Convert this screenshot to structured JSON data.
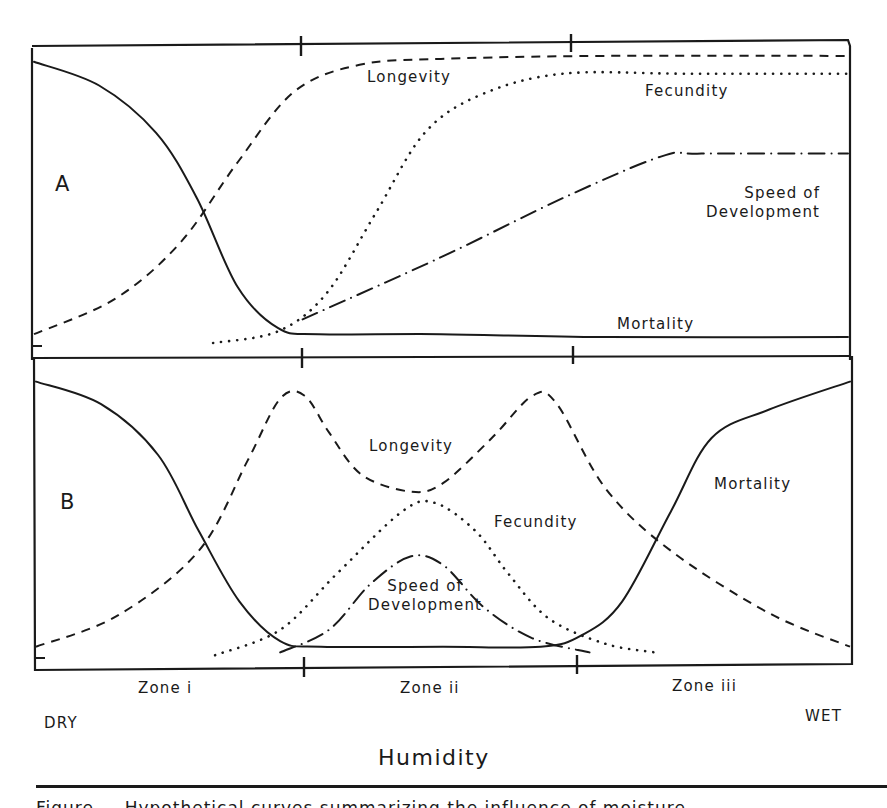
{
  "figure": {
    "panel_a_label": "A",
    "panel_b_label": "B",
    "axis_title": "Humidity",
    "dry_label": "DRY",
    "wet_label": "WET",
    "zones": [
      "Zone i",
      "Zone ii",
      "Zone iii"
    ],
    "caption": "Figure — Hypothetical curves summarizing the influence of moisture ..."
  },
  "labels": {
    "a": {
      "longevity": "Longevity",
      "fecundity": "Fecundity",
      "speed_line1": "Speed of",
      "speed_line2": "Development",
      "mortality": "Mortality"
    },
    "b": {
      "longevity": "Longevity",
      "fecundity": "Fecundity",
      "speed_line1": "Speed of",
      "speed_line2": "Development",
      "mortality": "Mortality"
    }
  },
  "colors": {
    "ink": "#1a1a1a",
    "background": "#ffffff"
  },
  "chart_data": {
    "type": "line",
    "title": "",
    "xlabel": "Humidity",
    "x_range_labels": [
      "DRY",
      "WET"
    ],
    "zone_boundaries": [
      "Zone i | Zone ii",
      "Zone ii | Zone iii"
    ],
    "zones": [
      "Zone i",
      "Zone ii",
      "Zone iii"
    ],
    "note": "Hypothetical (unitless) curves; x = 0 (dry) to 1 (wet), y = 0 (low) to 1 (high). Zone boundaries at x≈0.33 and x≈0.67.",
    "grid": false,
    "panels": [
      {
        "panel": "A",
        "series": [
          {
            "name": "Mortality",
            "style": "solid",
            "points": [
              [
                0,
                0.96
              ],
              [
                0.08,
                0.88
              ],
              [
                0.15,
                0.72
              ],
              [
                0.2,
                0.5
              ],
              [
                0.25,
                0.2
              ],
              [
                0.3,
                0.06
              ],
              [
                0.35,
                0.04
              ],
              [
                0.5,
                0.04
              ],
              [
                0.7,
                0.03
              ],
              [
                1,
                0.03
              ]
            ]
          },
          {
            "name": "Longevity",
            "style": "dashed",
            "points": [
              [
                0,
                0.04
              ],
              [
                0.1,
                0.16
              ],
              [
                0.18,
                0.35
              ],
              [
                0.25,
                0.62
              ],
              [
                0.32,
                0.86
              ],
              [
                0.4,
                0.95
              ],
              [
                0.5,
                0.97
              ],
              [
                0.7,
                0.98
              ],
              [
                1,
                0.98
              ]
            ]
          },
          {
            "name": "Fecundity",
            "style": "dotted",
            "points": [
              [
                0.22,
                0.01
              ],
              [
                0.3,
                0.05
              ],
              [
                0.36,
                0.18
              ],
              [
                0.42,
                0.45
              ],
              [
                0.48,
                0.72
              ],
              [
                0.55,
                0.85
              ],
              [
                0.65,
                0.92
              ],
              [
                0.8,
                0.92
              ],
              [
                1,
                0.92
              ]
            ]
          },
          {
            "name": "Speed of Development",
            "style": "dash-dot",
            "points": [
              [
                0.33,
                0.09
              ],
              [
                0.5,
                0.3
              ],
              [
                0.65,
                0.5
              ],
              [
                0.77,
                0.64
              ],
              [
                0.82,
                0.65
              ],
              [
                1,
                0.65
              ]
            ]
          }
        ]
      },
      {
        "panel": "B",
        "series": [
          {
            "name": "Mortality",
            "style": "solid",
            "points": [
              [
                0,
                0.98
              ],
              [
                0.08,
                0.9
              ],
              [
                0.15,
                0.72
              ],
              [
                0.2,
                0.45
              ],
              [
                0.25,
                0.2
              ],
              [
                0.3,
                0.06
              ],
              [
                0.35,
                0.04
              ],
              [
                0.5,
                0.04
              ],
              [
                0.62,
                0.04
              ],
              [
                0.67,
                0.08
              ],
              [
                0.72,
                0.2
              ],
              [
                0.78,
                0.52
              ],
              [
                0.83,
                0.78
              ],
              [
                0.9,
                0.88
              ],
              [
                1,
                0.98
              ]
            ]
          },
          {
            "name": "Longevity",
            "style": "dashed",
            "points": [
              [
                0,
                0.04
              ],
              [
                0.1,
                0.15
              ],
              [
                0.2,
                0.38
              ],
              [
                0.26,
                0.7
              ],
              [
                0.3,
                0.92
              ],
              [
                0.33,
                0.93
              ],
              [
                0.36,
                0.8
              ],
              [
                0.4,
                0.65
              ],
              [
                0.46,
                0.59
              ],
              [
                0.5,
                0.62
              ],
              [
                0.56,
                0.78
              ],
              [
                0.61,
                0.93
              ],
              [
                0.64,
                0.9
              ],
              [
                0.7,
                0.6
              ],
              [
                0.78,
                0.38
              ],
              [
                0.9,
                0.16
              ],
              [
                1,
                0.04
              ]
            ]
          },
          {
            "name": "Fecundity",
            "style": "dotted",
            "points": [
              [
                0.22,
                0.01
              ],
              [
                0.3,
                0.1
              ],
              [
                0.37,
                0.3
              ],
              [
                0.45,
                0.52
              ],
              [
                0.49,
                0.55
              ],
              [
                0.54,
                0.45
              ],
              [
                0.58,
                0.3
              ],
              [
                0.63,
                0.14
              ],
              [
                0.7,
                0.05
              ],
              [
                0.76,
                0.02
              ]
            ]
          },
          {
            "name": "Speed of Development",
            "style": "dash-dot",
            "points": [
              [
                0.3,
                0.02
              ],
              [
                0.36,
                0.1
              ],
              [
                0.41,
                0.26
              ],
              [
                0.46,
                0.36
              ],
              [
                0.5,
                0.33
              ],
              [
                0.55,
                0.18
              ],
              [
                0.61,
                0.07
              ],
              [
                0.68,
                0.02
              ]
            ]
          }
        ]
      }
    ]
  }
}
